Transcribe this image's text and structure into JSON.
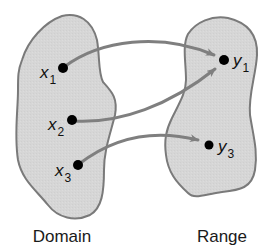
{
  "diagram": {
    "type": "function-mapping",
    "colors": {
      "blob_fill": "#d6d6d6",
      "blob_stroke": "#7a7a7a",
      "arrow": "#7f7f7f",
      "dot": "#000000",
      "text": "#111111"
    },
    "sets": {
      "domain": {
        "label": "Domain",
        "elements": [
          {
            "id": "x1",
            "base": "x",
            "sub": "1"
          },
          {
            "id": "x2",
            "base": "x",
            "sub": "2"
          },
          {
            "id": "x3",
            "base": "x",
            "sub": "3"
          }
        ]
      },
      "range": {
        "label": "Range",
        "elements": [
          {
            "id": "y1",
            "base": "y",
            "sub": "1"
          },
          {
            "id": "y3",
            "base": "y",
            "sub": "3"
          }
        ]
      }
    },
    "mappings": [
      {
        "from": "x1",
        "to": "y1"
      },
      {
        "from": "x2",
        "to": "y1"
      },
      {
        "from": "x3",
        "to": "y3"
      }
    ]
  }
}
